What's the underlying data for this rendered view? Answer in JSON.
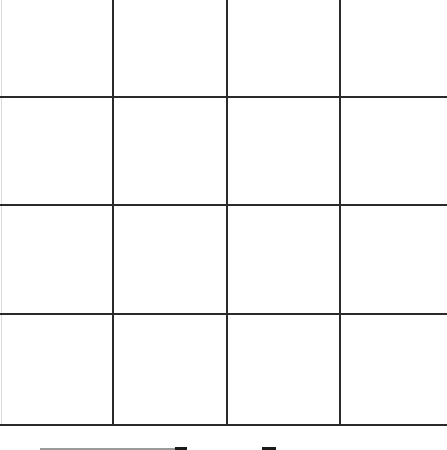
{
  "board": {
    "rows": 4,
    "cols": 4,
    "line_color": "#2a2a2a",
    "background": "#ffffff",
    "vertical_lines_x": [
      112,
      226,
      339
    ],
    "horizontal_lines_y": [
      96,
      204,
      313,
      424
    ],
    "cells": [
      [
        "",
        "",
        "",
        ""
      ],
      [
        "",
        "",
        "",
        ""
      ],
      [
        "",
        "",
        "",
        ""
      ],
      [
        "",
        "",
        "",
        ""
      ]
    ]
  },
  "bottom_fragments": [
    {
      "x": 40,
      "width": 135,
      "color": "#9a9a9a"
    },
    {
      "x": 175,
      "width": 12,
      "color": "#1a1a1a"
    },
    {
      "x": 262,
      "width": 14,
      "color": "#1a1a1a"
    }
  ]
}
